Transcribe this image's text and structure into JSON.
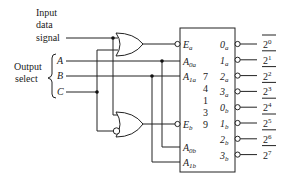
{
  "diagram": {
    "type": "logic-schematic",
    "labels": {
      "input_line1": "Input",
      "input_line2": "data",
      "input_line3": "signal",
      "output_select_line1": "Output",
      "output_select_line2": "select",
      "sel_a": "A",
      "sel_b": "B",
      "sel_c": "C"
    },
    "chip": {
      "part_number_digits": [
        "7",
        "4",
        "1",
        "3",
        "9"
      ],
      "inputs": {
        "ea": {
          "main": "E",
          "sub": "a"
        },
        "a0a": {
          "main": "A",
          "sub": "0a"
        },
        "a1a": {
          "main": "A",
          "sub": "1a"
        },
        "eb": {
          "main": "E",
          "sub": "b"
        },
        "a0b": {
          "main": "A",
          "sub": "0b"
        },
        "a1b": {
          "main": "A",
          "sub": "1b"
        }
      },
      "outputs": [
        {
          "main": "0",
          "sub": "a",
          "signal_base": "2",
          "signal_exp": "0"
        },
        {
          "main": "1",
          "sub": "a",
          "signal_base": "2",
          "signal_exp": "1"
        },
        {
          "main": "2",
          "sub": "a",
          "signal_base": "2",
          "signal_exp": "2"
        },
        {
          "main": "3",
          "sub": "a",
          "signal_base": "2",
          "signal_exp": "3"
        },
        {
          "main": "0",
          "sub": "b",
          "signal_base": "2",
          "signal_exp": "4"
        },
        {
          "main": "1",
          "sub": "b",
          "signal_base": "2",
          "signal_exp": "5"
        },
        {
          "main": "2",
          "sub": "b",
          "signal_base": "2",
          "signal_exp": "6"
        },
        {
          "main": "3",
          "sub": "b",
          "signal_base": "2",
          "signal_exp": "7"
        }
      ]
    },
    "gates": [
      {
        "id": "gate-a",
        "type": "OR"
      },
      {
        "id": "gate-b",
        "type": "OR",
        "inverted_input": "C"
      }
    ]
  }
}
